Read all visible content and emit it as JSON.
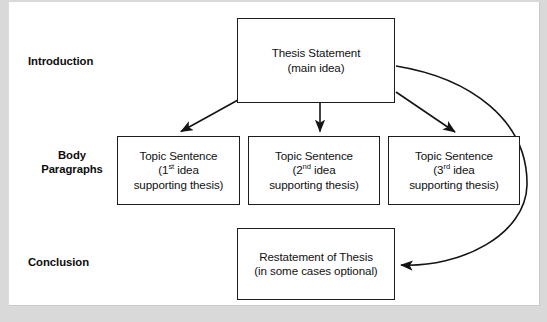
{
  "diagram": {
    "type": "flowchart",
    "background_color": "#d9d9d9",
    "page_color": "#ffffff",
    "line_color": "#1c1c1c",
    "text_color": "#111111"
  },
  "stage_labels": [
    {
      "id": "introduction",
      "text": "Introduction"
    },
    {
      "id": "body-paragraphs",
      "line1": "Body",
      "line2": "Paragraphs"
    },
    {
      "id": "conclusion",
      "text": "Conclusion"
    }
  ],
  "nodes": {
    "thesis": {
      "line1": "Thesis Statement",
      "line2": "(main idea)"
    },
    "topic_1": {
      "line1": "Topic Sentence",
      "line2_pre": "(1",
      "line2_sup": "st",
      "line2_post": " idea",
      "line3": "supporting thesis)"
    },
    "topic_2": {
      "line1": "Topic Sentence",
      "line2_pre": "(2",
      "line2_sup": "nd",
      "line2_post": " idea",
      "line3": "supporting thesis)"
    },
    "topic_3": {
      "line1": "Topic Sentence",
      "line2_pre": "(3",
      "line2_sup": "rd",
      "line2_post": " idea",
      "line3": "supporting thesis)"
    },
    "conclusion": {
      "line1": "Restatement of Thesis",
      "line2": "(in some cases optional)"
    }
  },
  "connectors": [
    {
      "id": "thesis-to-topic-1",
      "from": "thesis",
      "to": "topic_1",
      "style": "straight-diagonal-arrow"
    },
    {
      "id": "thesis-to-topic-2",
      "from": "thesis",
      "to": "topic_2",
      "style": "straight-vertical-arrow"
    },
    {
      "id": "thesis-to-topic-3",
      "from": "thesis",
      "to": "topic_3",
      "style": "straight-diagonal-arrow"
    },
    {
      "id": "thesis-to-conclusion",
      "from": "thesis",
      "to": "conclusion",
      "style": "curved-arrow"
    }
  ]
}
